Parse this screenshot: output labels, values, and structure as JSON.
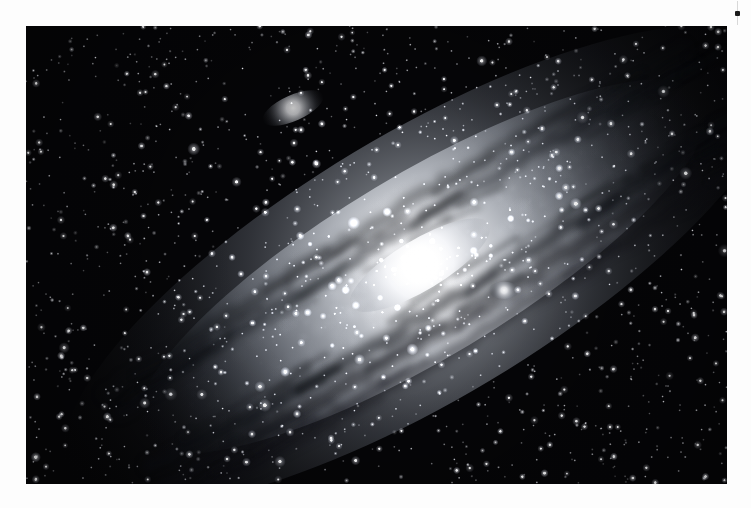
{
  "page": {
    "background_color": "#fdfdfd"
  },
  "photo": {
    "name": "andromeda-galaxy-photograph",
    "alt_text": "Grayscale astrophotograph of the Andromeda Galaxy M31 with satellite galaxies M32 and M110 against a dense star field",
    "frame": {
      "x": 26,
      "y": 26,
      "width": 701,
      "height": 458
    },
    "style": "monochrome long-exposure astrophotograph",
    "background_color": "#050507",
    "core_color": "#ffffff",
    "halo_color": "#b9bcc2",
    "dust_lane_color": "#1d2026"
  },
  "scene": {
    "objects": [
      {
        "label": "M31 disk",
        "type": "spiral-galaxy-disk",
        "center_x": 0.565,
        "center_y": 0.525,
        "radius_x": 0.47,
        "radius_y": 0.2,
        "rotation_deg": -31,
        "brightness": 0.7
      },
      {
        "label": "M31 core",
        "type": "galaxy-core",
        "center_x": 0.562,
        "center_y": 0.522,
        "radius_x": 0.115,
        "radius_y": 0.055,
        "rotation_deg": -31,
        "brightness": 1.0
      },
      {
        "label": "M110 (NGC 205)",
        "type": "elliptical-satellite-galaxy",
        "center_x": 0.381,
        "center_y": 0.179,
        "radius_x": 0.047,
        "radius_y": 0.028,
        "rotation_deg": -24,
        "brightness": 0.78
      },
      {
        "label": "M32 (NGC 221)",
        "type": "compact-satellite-galaxy",
        "center_x": 0.682,
        "center_y": 0.577,
        "radius_x": 0.022,
        "radius_y": 0.019,
        "rotation_deg": 0,
        "brightness": 0.95
      }
    ],
    "dust_lanes": [
      {
        "offset": 0.072,
        "width": 0.03,
        "opacity": 0.5
      },
      {
        "offset": 0.118,
        "width": 0.034,
        "opacity": 0.46
      },
      {
        "offset": 0.168,
        "width": 0.03,
        "opacity": 0.38
      },
      {
        "offset": -0.07,
        "width": 0.026,
        "opacity": 0.42
      },
      {
        "offset": -0.112,
        "width": 0.03,
        "opacity": 0.36
      }
    ],
    "star_field": {
      "count": 1500,
      "seed": 20240731,
      "color": "#ffffff",
      "min_radius": 0.25,
      "max_radius": 1.9
    },
    "bright_stars": {
      "count": 70,
      "seed": 99137,
      "color": "#ffffff",
      "min_radius": 1.5,
      "max_radius": 2.9
    }
  },
  "cursor": {
    "name": "cursor-artifact",
    "x": 737,
    "y": 1,
    "stem_color": "#d8d8d8",
    "knob_color": "#1a1a1a"
  }
}
